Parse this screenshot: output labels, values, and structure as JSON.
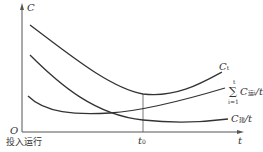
{
  "diagram": {
    "type": "cost-curve",
    "axes": {
      "y_label": "C",
      "x_label": "t",
      "origin_label": "O",
      "origin_caption": "投入运行",
      "marker_label": "t",
      "marker_sub": "0"
    },
    "curves": [
      {
        "id": "total",
        "label": "C",
        "label_sub": "t",
        "suffix": ""
      },
      {
        "id": "operating",
        "label": "C",
        "label_sub": "运i",
        "suffix": "/t",
        "sum_top": "t",
        "sum_bottom": "i=1",
        "sum_symbol": "∑"
      },
      {
        "id": "construction",
        "label": "C",
        "label_sub": "建",
        "suffix": "/t"
      }
    ],
    "colors": {
      "line": "#333333",
      "background": "#ffffff"
    }
  }
}
